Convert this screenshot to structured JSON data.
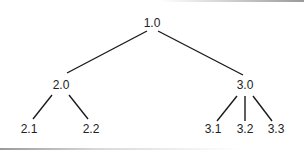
{
  "diagram": {
    "type": "tree",
    "nodes": [
      {
        "id": "n1_0",
        "label": "1.0",
        "parent": null
      },
      {
        "id": "n2_0",
        "label": "2.0",
        "parent": "n1_0"
      },
      {
        "id": "n3_0",
        "label": "3.0",
        "parent": "n1_0"
      },
      {
        "id": "n2_1",
        "label": "2.1",
        "parent": "n2_0"
      },
      {
        "id": "n2_2",
        "label": "2.2",
        "parent": "n2_0"
      },
      {
        "id": "n3_1",
        "label": "3.1",
        "parent": "n3_0"
      },
      {
        "id": "n3_2",
        "label": "3.2",
        "parent": "n3_0"
      },
      {
        "id": "n3_3",
        "label": "3.3",
        "parent": "n3_0"
      }
    ],
    "colors": {
      "line": "#1a1a1a",
      "text": "#222222",
      "background": "#ffffff"
    }
  }
}
